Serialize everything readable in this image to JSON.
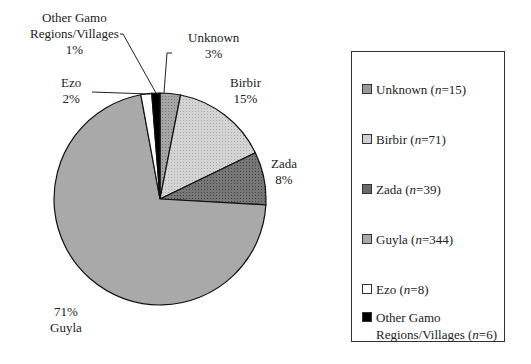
{
  "chart_data": {
    "type": "pie",
    "title": "",
    "categories": [
      "Unknown",
      "Birbir",
      "Zada",
      "Guyla",
      "Ezo",
      "Other Gamo Regions/Villages"
    ],
    "values": [
      15,
      71,
      39,
      344,
      8,
      6
    ],
    "percent_labels": [
      "3%",
      "15%",
      "8%",
      "71%",
      "2%",
      "1%"
    ],
    "colors": [
      "#9a9a9a",
      "#cfcfcf",
      "#6f6f6f",
      "#a9a9a9",
      "#ffffff",
      "#000000"
    ],
    "legend_position": "right",
    "legend": [
      {
        "name": "Unknown",
        "n": "15"
      },
      {
        "name": "Birbir",
        "n": "71"
      },
      {
        "name": "Zada",
        "n": "39"
      },
      {
        "name": "Guyla",
        "n": "344"
      },
      {
        "name": "Ezo",
        "n": "8"
      },
      {
        "name": "Other Gamo Regions/Villages",
        "n": "6"
      }
    ]
  },
  "labels": {
    "unknown": {
      "name": "Unknown",
      "pct": "3%"
    },
    "birbir": {
      "name": "Birbir",
      "pct": "15%"
    },
    "zada": {
      "name": "Zada",
      "pct": "8%"
    },
    "guyla": {
      "name": "Guyla",
      "pct": "71%"
    },
    "ezo": {
      "name": "Ezo",
      "pct": "2%"
    },
    "other": {
      "name1": "Other Gamo",
      "name2": "Regions/Villages",
      "pct": "1%"
    }
  },
  "legend": {
    "n_symbol": "n",
    "items": [
      {
        "name": "Unknown",
        "n": "15"
      },
      {
        "name": "Birbir",
        "n": "71"
      },
      {
        "name": "Zada",
        "n": "39"
      },
      {
        "name": "Guyla",
        "n": "344"
      },
      {
        "name": "Ezo",
        "n": "8"
      },
      {
        "name1": "Other Gamo",
        "name2": "Regions/Villages",
        "n": "6"
      }
    ]
  }
}
